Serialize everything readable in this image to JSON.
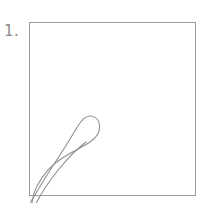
{
  "page": {
    "background_color": "#ffffff",
    "width": 214,
    "height": 207,
    "kind": "drawing-tutorial-step"
  },
  "step_label": {
    "text": "1.",
    "color": "#8a8a8a"
  },
  "frame": {
    "name": "drawing-canvas-frame",
    "border_color": "#9b9b9b",
    "fill_color": "#ffffff",
    "x": 29,
    "y": 22,
    "width": 167,
    "height": 174
  },
  "artwork": {
    "name": "petal-outline-sketch",
    "description": "Elongated teardrop petal outline rising diagonally from lower-left to a narrow rounded hook near the middle of the frame",
    "stroke_color": "#8f8f8f",
    "stroke_width": 1.1,
    "fill": "none",
    "strokes": [
      {
        "name": "petal-left-edge",
        "path": "M 30.5 202.5 C 36 193 48 173 58 158 C 66 146 73 134 78 126 C 81.5 120 86 115.5 91 116 C 96.5 116.6 99.5 121 99.6 126.5"
      },
      {
        "name": "petal-right-edge",
        "path": "M 99.6 126.5 C 99.7 132.5 96 138 90 142 C 83 146.6 74 151 64 157 C 52 164 42 176 36.5 187 C 34 192 32.6 197.5 32 202.5"
      },
      {
        "name": "petal-inner-crease",
        "path": "M 36.5 202.5 C 41 194 50 180 59 169 C 68 158 78 148 86 142"
      }
    ]
  }
}
